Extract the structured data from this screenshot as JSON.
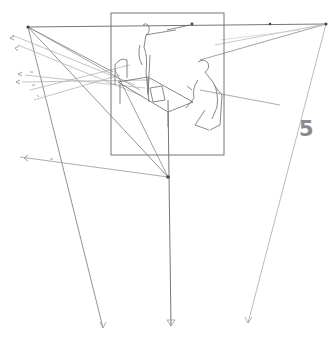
{
  "figure": {
    "type": "perspective-sketch",
    "page_number": "5",
    "colors": {
      "background": "#ffffff",
      "line_dark": "#555555",
      "line_light": "#b5b5b5",
      "number": "#8a8a8a"
    },
    "vanishing_points": {
      "left": [
        28,
        27
      ],
      "right": [
        326,
        24
      ],
      "bottom": [
        168,
        177
      ],
      "top_mid": [
        192,
        24
      ],
      "right_mid": [
        270,
        24
      ]
    },
    "frame": {
      "x": 111,
      "y": 13,
      "w": 113,
      "h": 142
    },
    "bottom_arrows": [
      [
        103,
        328
      ],
      [
        171,
        326
      ],
      [
        248,
        323
      ]
    ]
  }
}
